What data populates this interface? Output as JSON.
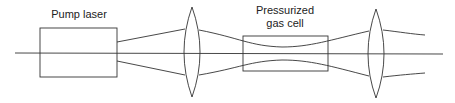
{
  "diagram": {
    "components": [
      {
        "id": "pump-laser",
        "label": "Pump laser",
        "type": "box"
      },
      {
        "id": "lens-1",
        "label": "",
        "type": "convex-lens"
      },
      {
        "id": "gas-cell",
        "label_line1": "Pressurized",
        "label_line2": "gas cell",
        "type": "box"
      },
      {
        "id": "lens-2",
        "label": "",
        "type": "convex-lens"
      }
    ],
    "colors": {
      "line": "#333333",
      "text": "#222222",
      "background": "#ffffff"
    }
  },
  "labels": {
    "pump_laser": "Pump laser",
    "gas_cell_line1": "Pressurized",
    "gas_cell_line2": "gas cell"
  }
}
